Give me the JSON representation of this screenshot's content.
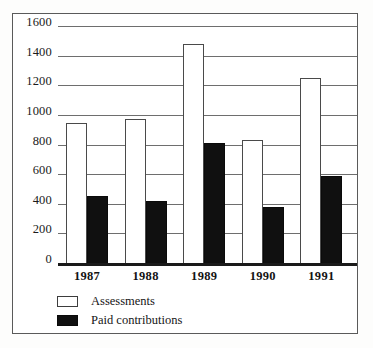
{
  "chart_data": {
    "type": "bar",
    "title": "",
    "subtitle": "",
    "xlabel": "",
    "ylabel": "",
    "categories": [
      "1987",
      "1988",
      "1989",
      "1990",
      "1991"
    ],
    "series": [
      {
        "name": "Assessments",
        "color": "#ffffff",
        "values": [
          945,
          975,
          1480,
          830,
          1250
        ]
      },
      {
        "name": "Paid contributions",
        "color": "#101010",
        "values": [
          450,
          420,
          810,
          375,
          590
        ]
      }
    ],
    "ylim": [
      0,
      1600
    ],
    "yticks": [
      0,
      200,
      400,
      600,
      800,
      1000,
      1200,
      1400,
      1600
    ],
    "ytick_labels": [
      "0",
      "200",
      "400",
      "600",
      "800",
      "1000",
      "1200",
      "1400",
      "1600"
    ],
    "grid": true,
    "legend_position": "bottom-left",
    "frame": true
  },
  "legend": {
    "items": [
      {
        "label": "Assessments",
        "swatch": "hollow-square-swatch"
      },
      {
        "label": "Paid contributions",
        "swatch": "filled-square-swatch"
      }
    ]
  }
}
